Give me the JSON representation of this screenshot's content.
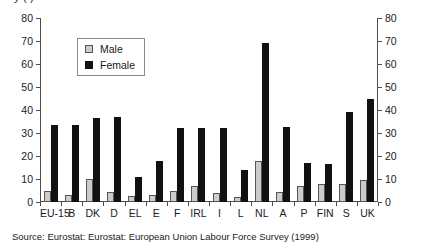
{
  "title_clipped": "y    (    )",
  "legend": {
    "position": "inside-top-left",
    "items": [
      {
        "label": "Male",
        "color": "#cccccc",
        "name": "male"
      },
      {
        "label": "Female",
        "color": "#111111",
        "name": "female"
      }
    ]
  },
  "source": "Source: Eurostat: Eurostat: European Union Labour Force Survey (1999)",
  "chart_data": {
    "type": "bar",
    "title": "",
    "xlabel": "",
    "ylabel": "",
    "ylim": [
      0,
      80
    ],
    "yticks": [
      0,
      10,
      20,
      30,
      40,
      50,
      60,
      70,
      80
    ],
    "ytick_labels": [
      "0",
      "10",
      "20",
      "30",
      "40",
      "50",
      "60",
      "70",
      "80"
    ],
    "dual_axis": true,
    "grid": false,
    "legend_entries": [
      "Male",
      "Female"
    ],
    "categories": [
      "EU-15",
      "B",
      "DK",
      "D",
      "EL",
      "E",
      "F",
      "IRL",
      "I",
      "L",
      "NL",
      "A",
      "P",
      "FIN",
      "S",
      "UK"
    ],
    "series": [
      {
        "name": "Male",
        "color": "#cccccc",
        "values": [
          5,
          3,
          10,
          4.5,
          2.5,
          3,
          5,
          7,
          4,
          2,
          18,
          4.5,
          7,
          8,
          8,
          9.5
        ]
      },
      {
        "name": "Female",
        "color": "#111111",
        "values": [
          33.5,
          33.5,
          36.5,
          37,
          11,
          18,
          32,
          32,
          32,
          14,
          69,
          32.5,
          17,
          16.5,
          39,
          45
        ]
      }
    ]
  }
}
